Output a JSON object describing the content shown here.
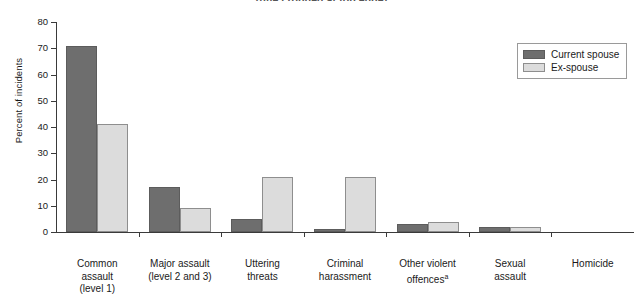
{
  "chart_data": {
    "type": "bar",
    "title": "(title cropped at top edge)",
    "xlabel": "",
    "ylabel": "Percent of incidents",
    "ylim": [
      0,
      80
    ],
    "ytick_step": 10,
    "yticks": [
      80,
      70,
      60,
      50,
      40,
      30,
      20,
      10,
      0
    ],
    "grid": false,
    "legend_position": "top-right",
    "categories": [
      [
        "Common",
        "assault",
        "(level 1)"
      ],
      [
        "Major assault",
        "(level 2 and 3)"
      ],
      [
        "Uttering",
        "threats"
      ],
      [
        "Criminal",
        "harassment"
      ],
      [
        "Other violent",
        "offences"
      ],
      [
        "Sexual",
        "assault"
      ],
      [
        "Homicide"
      ]
    ],
    "category_footnote_index": 4,
    "category_footnote_marker": "a",
    "series": [
      {
        "name": "Current spouse",
        "color": "#6e6e6e",
        "values": [
          71,
          17,
          5,
          1,
          3,
          2,
          0
        ]
      },
      {
        "name": "Ex-spouse",
        "color": "#dcdcdc",
        "values": [
          41,
          9,
          21,
          21,
          4,
          2,
          0
        ]
      }
    ]
  },
  "legend": {
    "items": [
      {
        "label": "Current spouse"
      },
      {
        "label": "Ex-spouse"
      }
    ]
  }
}
